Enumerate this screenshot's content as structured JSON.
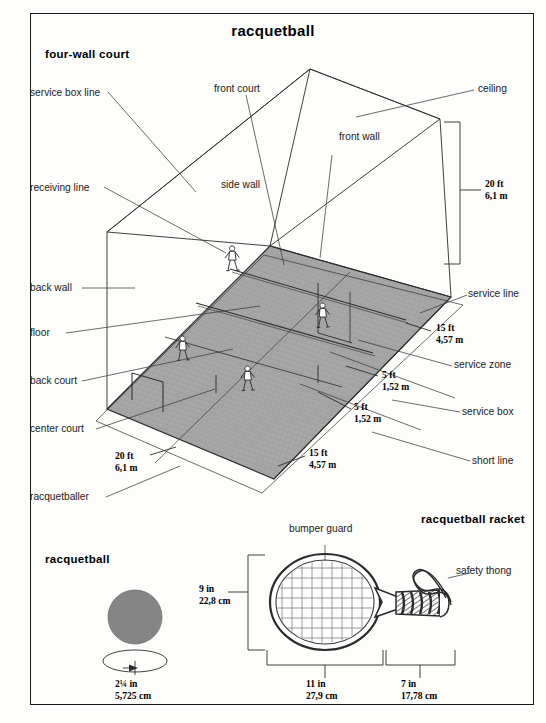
{
  "page": {
    "title": "racquetball",
    "border_color": "#1a1a1a",
    "background": "#fdfdfc"
  },
  "sections": {
    "four_wall_court": "four-wall court",
    "racquetball_ball": "racquetball",
    "racquetball_racket": "racquetball racket"
  },
  "court": {
    "floor_fill": "#a8a8a8",
    "labels_left": [
      {
        "id": "service-box-line",
        "text": "service box line",
        "x": 30,
        "y": 88
      },
      {
        "id": "receiving-line",
        "text": "receiving line",
        "x": 30,
        "y": 183
      },
      {
        "id": "back-wall",
        "text": "back wall",
        "x": 30,
        "y": 283
      },
      {
        "id": "floor",
        "text": "floor",
        "x": 30,
        "y": 330
      },
      {
        "id": "back-court",
        "text": "back court",
        "x": 30,
        "y": 378
      },
      {
        "id": "center-court",
        "text": "center court",
        "x": 30,
        "y": 425
      },
      {
        "id": "racquetballer",
        "text": "racquetballer",
        "x": 30,
        "y": 495
      }
    ],
    "labels_inner": [
      {
        "id": "front-court",
        "text": "front court",
        "x": 214,
        "y": 88
      },
      {
        "id": "front-wall",
        "text": "front wall",
        "x": 339,
        "y": 136
      },
      {
        "id": "side-wall",
        "text": "side wall",
        "x": 221,
        "y": 183
      }
    ],
    "labels_right": [
      {
        "id": "ceiling",
        "text": "ceiling",
        "x": 478,
        "y": 88
      },
      {
        "id": "service-line",
        "text": "service line",
        "x": 470,
        "y": 293
      },
      {
        "id": "service-zone",
        "text": "service zone",
        "x": 455,
        "y": 363
      },
      {
        "id": "service-box",
        "text": "service box",
        "x": 463,
        "y": 410
      },
      {
        "id": "short-line",
        "text": "short line",
        "x": 473,
        "y": 459
      }
    ],
    "dimensions": [
      {
        "id": "wall-height",
        "ft": "20 ft",
        "m": "6,1 m",
        "x": 485,
        "y": 181
      },
      {
        "id": "back-depth",
        "ft": "20 ft",
        "m": "6,1 m",
        "x": 118,
        "y": 452
      },
      {
        "id": "service-depth",
        "ft": "15 ft",
        "m": "4,57 m",
        "x": 436,
        "y": 325
      },
      {
        "id": "box-width",
        "ft": "5 ft",
        "m": "1,52 m",
        "x": 383,
        "y": 372
      },
      {
        "id": "box-depth",
        "ft": "5 ft",
        "m": "1,52 m",
        "x": 355,
        "y": 404
      },
      {
        "id": "front-depth",
        "ft": "15 ft",
        "m": "4,57 m",
        "x": 310,
        "y": 450
      }
    ]
  },
  "ball": {
    "fill": "#858585",
    "diameter": {
      "in": "2¼ in",
      "cm": "5,725 cm"
    }
  },
  "racket": {
    "labels": [
      {
        "id": "bumper-guard",
        "text": "bumper guard"
      },
      {
        "id": "safety-thong",
        "text": "safety thong"
      }
    ],
    "dimensions": [
      {
        "id": "head-height",
        "in": "9 in",
        "cm": "22,8 cm",
        "x": 199,
        "y": 585
      },
      {
        "id": "head-length",
        "in": "11 in",
        "cm": "27,9 cm",
        "x": 306,
        "y": 680
      },
      {
        "id": "grip-length",
        "in": "7 in",
        "cm": "17,78 cm",
        "x": 401,
        "y": 680
      }
    ]
  }
}
